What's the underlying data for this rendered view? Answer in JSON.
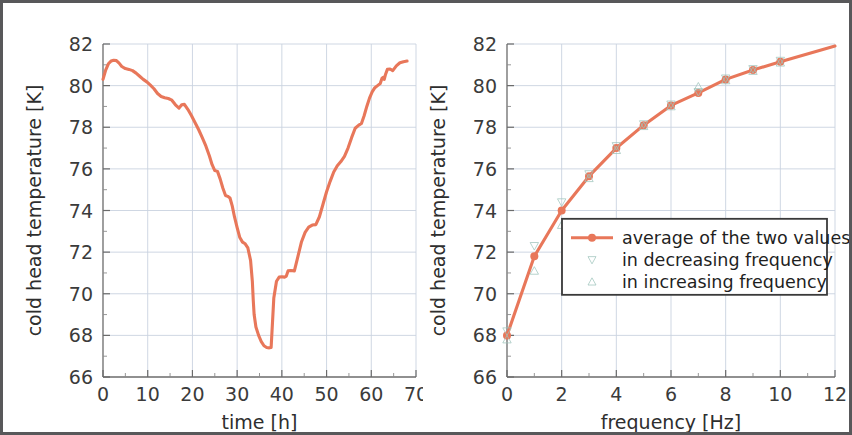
{
  "figure": {
    "background_color": "#ffffff",
    "border_color": "#58585a",
    "accent_color": "#e8775a",
    "grid_color": "#c9d2e0",
    "axis_color": "#6b6b6b"
  },
  "chart_data": [
    {
      "type": "line",
      "panel": "left",
      "title": "",
      "xlabel": "time [h]",
      "ylabel": "cold head temperature [K]",
      "xlim": [
        0,
        70
      ],
      "ylim": [
        66,
        82
      ],
      "xticks": [
        0,
        10,
        20,
        30,
        40,
        50,
        60,
        70
      ],
      "yticks": [
        66,
        68,
        70,
        72,
        74,
        76,
        78,
        80,
        82
      ],
      "grid": true,
      "legend": null,
      "series": [
        {
          "name": "cold head temperature",
          "color": "#e8775a",
          "x": [
            0.0,
            0.6,
            1.2,
            1.8,
            2.4,
            3.0,
            3.6,
            4.2,
            5.0,
            5.8,
            6.6,
            7.4,
            8.2,
            9.0,
            9.8,
            10.6,
            11.4,
            12.2,
            13.0,
            13.8,
            14.6,
            15.4,
            16.2,
            17.0,
            17.6,
            18.2,
            19.0,
            19.8,
            20.6,
            21.4,
            22.2,
            23.0,
            23.8,
            24.4,
            25.0,
            25.6,
            26.2,
            26.8,
            27.4,
            27.9,
            28.4,
            28.9,
            29.4,
            30.0,
            30.6,
            31.2,
            31.8,
            32.4,
            33.0,
            33.4,
            33.6,
            33.8,
            34.2,
            34.8,
            35.4,
            36.0,
            36.6,
            37.2,
            37.6,
            37.9,
            38.2,
            38.8,
            39.4,
            40.0,
            40.6,
            41.0,
            41.4,
            42.0,
            42.8,
            43.6,
            44.4,
            45.2,
            46.0,
            46.8,
            47.6,
            48.4,
            49.2,
            50.0,
            50.8,
            51.6,
            52.4,
            53.2,
            54.0,
            54.8,
            55.6,
            56.4,
            57.2,
            57.8,
            58.4,
            59.0,
            59.6,
            60.2,
            60.8,
            61.4,
            62.0,
            62.4,
            62.7,
            62.9,
            63.2,
            63.6,
            64.2,
            64.8,
            65.6,
            66.4,
            67.2,
            68.0
          ],
          "y": [
            80.3,
            80.75,
            81.05,
            81.18,
            81.22,
            81.2,
            81.08,
            80.92,
            80.82,
            80.78,
            80.72,
            80.6,
            80.45,
            80.3,
            80.18,
            80.02,
            79.85,
            79.62,
            79.48,
            79.42,
            79.38,
            79.3,
            79.08,
            78.92,
            79.08,
            79.1,
            78.85,
            78.55,
            78.22,
            77.88,
            77.5,
            77.1,
            76.62,
            76.2,
            75.92,
            75.88,
            75.52,
            75.08,
            74.72,
            74.68,
            74.6,
            74.22,
            73.7,
            73.18,
            72.7,
            72.48,
            72.4,
            72.2,
            71.6,
            70.6,
            69.7,
            69.0,
            68.4,
            68.0,
            67.7,
            67.5,
            67.42,
            67.4,
            67.42,
            68.6,
            69.8,
            70.6,
            70.8,
            70.82,
            70.8,
            70.85,
            71.1,
            71.12,
            71.1,
            71.8,
            72.5,
            72.95,
            73.2,
            73.3,
            73.32,
            73.7,
            74.3,
            74.9,
            75.4,
            75.85,
            76.15,
            76.35,
            76.6,
            77.0,
            77.5,
            77.95,
            78.1,
            78.18,
            78.55,
            79.0,
            79.4,
            79.7,
            79.9,
            80.0,
            80.1,
            80.35,
            80.4,
            80.3,
            80.55,
            80.78,
            80.8,
            80.72,
            80.95,
            81.1,
            81.15,
            81.18,
            81.2,
            81.18,
            81.16,
            80.2,
            78.4,
            76.1,
            73.7,
            72.0,
            71.1,
            70.4,
            69.7,
            69.1,
            68.82,
            68.7
          ]
        }
      ]
    },
    {
      "type": "line",
      "panel": "right",
      "title": "",
      "xlabel": "frequency [Hz]",
      "ylabel": "cold head temperature [K]",
      "xlim": [
        0,
        12
      ],
      "ylim": [
        66,
        82
      ],
      "xticks": [
        0,
        2,
        4,
        6,
        8,
        10,
        12
      ],
      "yticks": [
        66,
        68,
        70,
        72,
        74,
        76,
        78,
        80,
        82
      ],
      "grid": true,
      "legend": {
        "position": "center",
        "entries": [
          {
            "label": "average of the two values",
            "marker": "filled-circle-line",
            "color": "#e8775a"
          },
          {
            "label": "in decreasing frequency",
            "marker": "down-triangle",
            "color": "#9fc4bc"
          },
          {
            "label": "in increasing frequency",
            "marker": "up-triangle",
            "color": "#9fc4bc"
          }
        ]
      },
      "series": [
        {
          "name": "average of the two values",
          "color": "#e8775a",
          "marker": "filled-circle",
          "x": [
            0,
            1,
            2,
            3,
            4,
            5,
            6,
            7,
            8,
            9,
            10,
            12
          ],
          "y": [
            68.0,
            71.8,
            74.0,
            75.65,
            77.0,
            78.1,
            79.05,
            79.65,
            80.3,
            80.75,
            81.15,
            81.9
          ]
        },
        {
          "name": "in decreasing frequency",
          "color": "#9fc4bc",
          "marker": "down-triangle",
          "x": [
            0,
            1,
            2,
            3,
            4,
            5,
            6,
            7,
            8,
            9,
            10
          ],
          "y": [
            68.2,
            72.3,
            74.4,
            75.75,
            77.1,
            78.15,
            79.1,
            79.7,
            80.35,
            80.8,
            81.2
          ]
        },
        {
          "name": "in increasing frequency",
          "color": "#9fc4bc",
          "marker": "up-triangle",
          "x": [
            0,
            1,
            2,
            3,
            4,
            5,
            6,
            7,
            8,
            9,
            10
          ],
          "y": [
            67.8,
            71.1,
            73.3,
            75.55,
            76.9,
            78.05,
            79.0,
            79.95,
            80.25,
            80.7,
            81.1
          ]
        }
      ]
    }
  ]
}
